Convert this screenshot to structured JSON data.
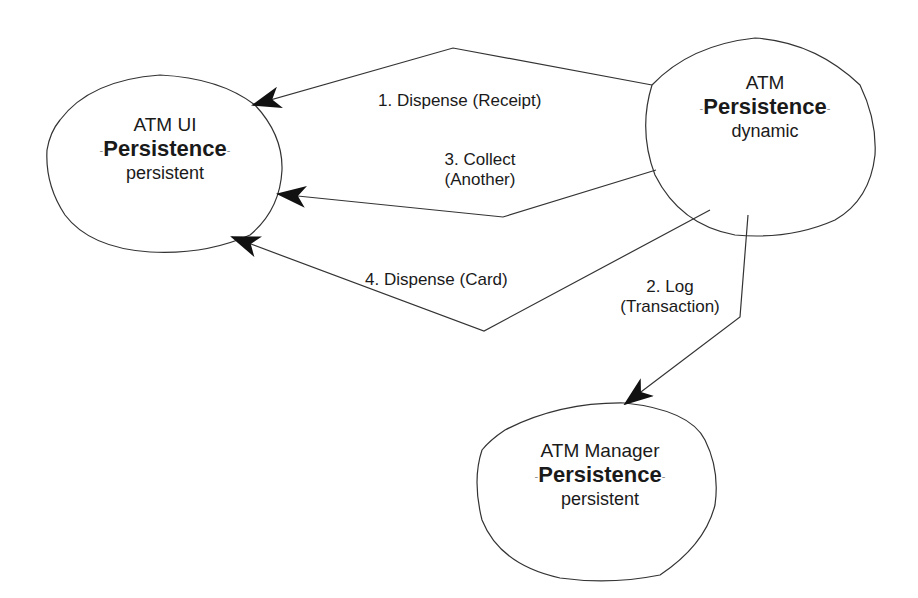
{
  "diagram": {
    "colors": {
      "stroke": "#333333",
      "text": "#1a1a1a",
      "background": "#ffffff"
    },
    "nodes": [
      {
        "id": "atm-ui",
        "name": "ATM UI",
        "stereotype": "Persistence",
        "kind": "persistent"
      },
      {
        "id": "atm",
        "name": "ATM",
        "stereotype": "Persistence",
        "kind": "dynamic"
      },
      {
        "id": "atm-manager",
        "name": "ATM Manager",
        "stereotype": "Persistence",
        "kind": "persistent"
      }
    ],
    "messages": [
      {
        "id": "m1",
        "label": "1. Dispense (Receipt)",
        "from": "ATM",
        "to": "ATM UI"
      },
      {
        "id": "m2",
        "label_line1": "2. Log",
        "label_line2": "(Transaction)",
        "from": "ATM",
        "to": "ATM Manager"
      },
      {
        "id": "m3",
        "label_line1": "3. Collect",
        "label_line2": "(Another)",
        "from": "ATM",
        "to": "ATM UI"
      },
      {
        "id": "m4",
        "label": "4. Dispense (Card)",
        "from": "ATM",
        "to": "ATM UI"
      }
    ],
    "dash": "-"
  }
}
